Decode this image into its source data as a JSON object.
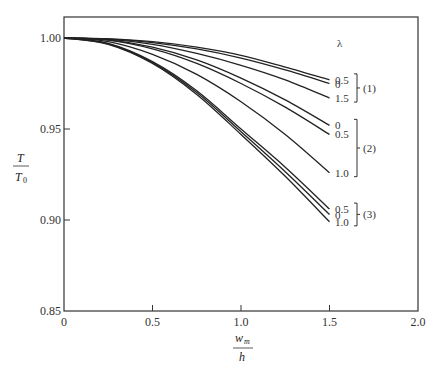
{
  "chart_data": {
    "type": "line",
    "title": "",
    "xlabel": "w_m / h",
    "ylabel": "T / T_0",
    "xlim": [
      0,
      2.0
    ],
    "ylim": [
      0.85,
      1.0
    ],
    "xticks": [
      "0",
      "0.5",
      "1.0",
      "1.5",
      "2.0"
    ],
    "yticks": [
      "0.85",
      "0.90",
      "0.95",
      "1.00"
    ],
    "grid": false,
    "legend_header": "λ",
    "x": [
      0,
      0.25,
      0.5,
      0.75,
      1.0,
      1.25,
      1.5
    ],
    "series": [
      {
        "name": "(1) λ=0.5",
        "group": "(1)",
        "lambda": "0.5",
        "values": [
          1.0,
          0.9995,
          0.998,
          0.995,
          0.9905,
          0.984,
          0.977
        ]
      },
      {
        "name": "(1) λ=0",
        "group": "(1)",
        "lambda": "0",
        "values": [
          1.0,
          0.9995,
          0.9975,
          0.994,
          0.989,
          0.9825,
          0.975
        ]
      },
      {
        "name": "(1) λ=1.5",
        "group": "(1)",
        "lambda": "1.5",
        "values": [
          1.0,
          0.9992,
          0.9965,
          0.9915,
          0.985,
          0.977,
          0.967
        ]
      },
      {
        "name": "(2) λ=0",
        "group": "(2)",
        "lambda": "0",
        "values": [
          1.0,
          0.999,
          0.995,
          0.988,
          0.978,
          0.966,
          0.952
        ]
      },
      {
        "name": "(2) λ=0.5",
        "group": "(2)",
        "lambda": "0.5",
        "values": [
          1.0,
          0.9988,
          0.994,
          0.986,
          0.975,
          0.962,
          0.947
        ]
      },
      {
        "name": "(2) λ=1.0",
        "group": "(2)",
        "lambda": "1.0",
        "values": [
          1.0,
          0.998,
          0.991,
          0.98,
          0.965,
          0.947,
          0.926
        ]
      },
      {
        "name": "(3) λ=0.5",
        "group": "(3)",
        "lambda": "0.5",
        "values": [
          1.0,
          0.997,
          0.987,
          0.971,
          0.95,
          0.929,
          0.906
        ]
      },
      {
        "name": "(3) λ=0",
        "group": "(3)",
        "lambda": "0",
        "values": [
          1.0,
          0.9968,
          0.9865,
          0.97,
          0.9485,
          0.9265,
          0.903
        ]
      },
      {
        "name": "(3) λ=1.0",
        "group": "(3)",
        "lambda": "1.0",
        "values": [
          1.0,
          0.9965,
          0.986,
          0.969,
          0.947,
          0.924,
          0.899
        ]
      }
    ],
    "annotations": {
      "groups": [
        {
          "label": "(1)",
          "lambdas": [
            "0.5",
            "0",
            "1.5"
          ]
        },
        {
          "label": "(2)",
          "lambdas": [
            "0",
            "0.5",
            "1.0"
          ]
        },
        {
          "label": "(3)",
          "lambdas": [
            "0.5",
            "0",
            "1.0"
          ]
        }
      ]
    }
  },
  "labels": {
    "y_num": "T",
    "y_den": "T",
    "y_den_sub": "0",
    "x_num": "w",
    "x_num_sub": "m",
    "x_den": "h",
    "lambda": "λ"
  }
}
